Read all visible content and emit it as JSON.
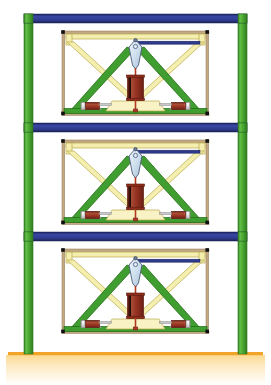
{
  "figure": {
    "type": "structural-schematic",
    "width": 271,
    "height": 385,
    "background": "#ffffff"
  },
  "colors": {
    "column_green": "#4aa832",
    "column_green_dark": "#2f7a1e",
    "beam_blue": "#2e3a8c",
    "beam_blue_dark": "#1d2560",
    "brace_green": "#3f9e2f",
    "brace_green_edge": "#1f6b12",
    "brace_yellow": "#f4efae",
    "brace_yellow_edge": "#b8a94a",
    "frame_tan": "#c4a882",
    "frame_tan_edge": "#8a7450",
    "kite_blue": "#cfe0ee",
    "kite_edge": "#4a5a78",
    "damper_red": "#a83a28",
    "damper_red_dark": "#6e2216",
    "damper_silver": "#f2f2f2",
    "damper_silver_edge": "#8a8a8a",
    "node_black": "#111111",
    "ground_orange": "#f2a32a",
    "ground_fill": "#fbe3a8",
    "rod_red": "#b03a20"
  },
  "geometry": {
    "columns": [
      {
        "name": "left-column",
        "x": 24,
        "width": 9
      },
      {
        "name": "right-column",
        "x": 238,
        "width": 9
      }
    ],
    "beams": [
      {
        "name": "roof-beam",
        "y": 14,
        "height": 9,
        "x": 24,
        "width": 223
      },
      {
        "name": "level-3-beam",
        "y": 123,
        "height": 9,
        "x": 24,
        "width": 223
      },
      {
        "name": "level-2-beam",
        "y": 232,
        "height": 9,
        "x": 24,
        "width": 223
      }
    ],
    "ground": {
      "name": "ground-line",
      "y": 352,
      "height": 3,
      "x": 8,
      "width": 255
    },
    "stories": [
      {
        "name": "story-3",
        "top": 23,
        "bottom": 123
      },
      {
        "name": "story-2",
        "top": 132,
        "bottom": 232
      },
      {
        "name": "story-1",
        "top": 241,
        "bottom": 352
      }
    ]
  },
  "components": {
    "outer_frame": "tan-secondary-frame",
    "inner_frame": "pale-yellow-toggle-frame",
    "chevron": "green-chevron-brace",
    "x_brace": "pale-yellow-x-brace",
    "kite": "light-blue-toggle-link",
    "vertical_damper": "red-coil-spring-damper",
    "horizontal_dampers": 2,
    "connector_bar": "navy-rigid-link",
    "nodes": "black-square-joints"
  },
  "labels": {
    "story_3": "Story 3",
    "story_2": "Story 2",
    "story_1": "Story 1",
    "roof": "Roof",
    "base": "Base"
  }
}
